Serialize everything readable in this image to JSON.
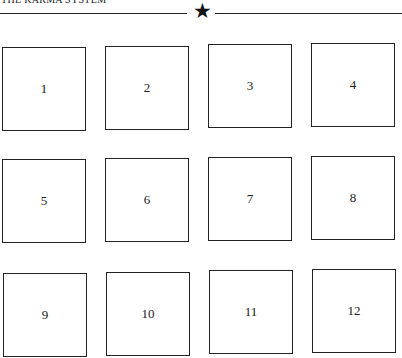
{
  "header": {
    "title": "THE KARMA SYSTEM",
    "divider_icon": "star-icon",
    "divider_glyph": "★"
  },
  "grid": {
    "boxes": [
      {
        "label": "1"
      },
      {
        "label": "2"
      },
      {
        "label": "3"
      },
      {
        "label": "4"
      },
      {
        "label": "5"
      },
      {
        "label": "6"
      },
      {
        "label": "7"
      },
      {
        "label": "8"
      },
      {
        "label": "9"
      },
      {
        "label": "10"
      },
      {
        "label": "11"
      },
      {
        "label": "12"
      }
    ]
  }
}
